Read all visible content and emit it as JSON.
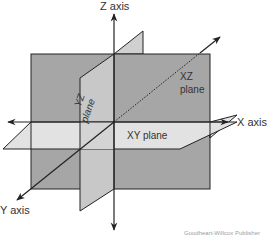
{
  "axes": {
    "z": "Z axis",
    "x": "X axis",
    "y": "Y axis"
  },
  "planes": {
    "yz_line1": "YZ",
    "yz_line2": "plane",
    "xz_line1": "XZ",
    "xz_line2": "plane",
    "xy": "XY plane"
  },
  "credit": "Goodheart-Willcox Publisher",
  "colors": {
    "xz_plane": "#a6a6a6",
    "yz_plane": "#c8c8c8",
    "xy_plane": "#e2e2e2",
    "line": "#222222"
  }
}
